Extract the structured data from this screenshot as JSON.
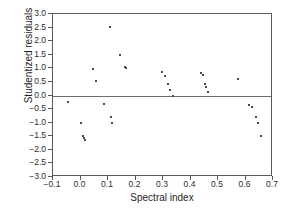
{
  "chart_data": {
    "type": "scatter",
    "title": "",
    "xlabel": "Spectral index",
    "ylabel": "Studentized residuals",
    "xlim": [
      -0.1,
      0.7
    ],
    "ylim": [
      -3.0,
      3.0
    ],
    "xticks": [
      -0.1,
      0.0,
      0.1,
      0.2,
      0.3,
      0.4,
      0.5,
      0.6,
      0.7
    ],
    "xtick_labels": [
      "−0.1",
      "0.0",
      "0.1",
      "0.2",
      "0.3",
      "0.4",
      "0.5",
      "0.6",
      "0.7"
    ],
    "yticks": [
      3.0,
      2.5,
      2.0,
      1.5,
      1.0,
      0.5,
      0.0,
      -0.5,
      -1.0,
      -1.5,
      -2.0,
      -2.5,
      -3.0
    ],
    "ytick_labels": [
      "3.0",
      "2.5",
      "2.0",
      "1.5",
      "1.0",
      "0.5",
      "0.0",
      "−0.5",
      "−1.0",
      "−1.5",
      "−2.0",
      "−2.5",
      "−3.0"
    ],
    "grid": false,
    "legend": false,
    "reference_lines": [
      {
        "axis": "y",
        "value": 0.0,
        "color": "#6e6e6e"
      }
    ],
    "marker_color": "#4a4a4a",
    "points": [
      {
        "x": -0.047,
        "y": -0.25
      },
      {
        "x": 0.002,
        "y": -1.0
      },
      {
        "x": 0.01,
        "y": -1.5
      },
      {
        "x": 0.013,
        "y": -1.58
      },
      {
        "x": 0.018,
        "y": -1.65
      },
      {
        "x": 0.047,
        "y": 0.98
      },
      {
        "x": 0.055,
        "y": 0.52
      },
      {
        "x": 0.085,
        "y": -0.3
      },
      {
        "x": 0.108,
        "y": 2.52
      },
      {
        "x": 0.11,
        "y": -0.78
      },
      {
        "x": 0.113,
        "y": -1.0
      },
      {
        "x": 0.143,
        "y": 1.5
      },
      {
        "x": 0.16,
        "y": 1.05
      },
      {
        "x": 0.165,
        "y": 1.02
      },
      {
        "x": 0.298,
        "y": 0.88
      },
      {
        "x": 0.308,
        "y": 0.72
      },
      {
        "x": 0.318,
        "y": 0.42
      },
      {
        "x": 0.325,
        "y": 0.22
      },
      {
        "x": 0.337,
        "y": 0.0
      },
      {
        "x": 0.437,
        "y": 0.82
      },
      {
        "x": 0.445,
        "y": 0.75
      },
      {
        "x": 0.452,
        "y": 0.42
      },
      {
        "x": 0.458,
        "y": 0.32
      },
      {
        "x": 0.463,
        "y": 0.12
      },
      {
        "x": 0.572,
        "y": 0.62
      },
      {
        "x": 0.612,
        "y": -0.35
      },
      {
        "x": 0.622,
        "y": -0.42
      },
      {
        "x": 0.638,
        "y": -0.78
      },
      {
        "x": 0.645,
        "y": -1.02
      },
      {
        "x": 0.658,
        "y": -1.5
      }
    ]
  }
}
